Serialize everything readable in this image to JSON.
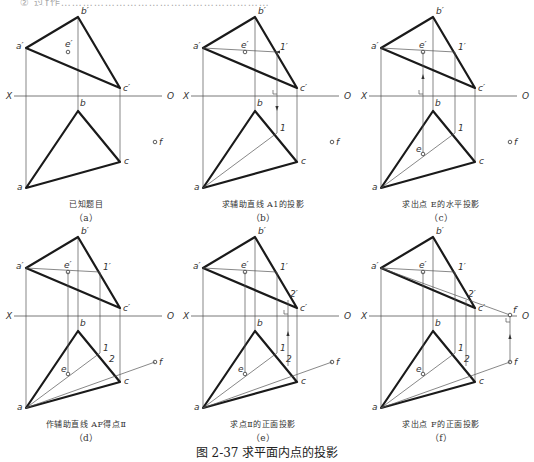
{
  "figure": {
    "title": "图 2-37   求平面内点的投影",
    "top_cut_text": "② 过f作…………………………………………………"
  },
  "labels": {
    "a_prime": "a′",
    "b_prime": "b′",
    "c_prime": "c′",
    "e_prime": "e′",
    "one_prime": "1′",
    "two_prime": "2′",
    "f_prime": "f′",
    "a": "a",
    "b": "b",
    "c": "c",
    "e": "e",
    "one": "1",
    "two": "2",
    "f": "f",
    "X": "X",
    "O": "O"
  },
  "panels": [
    {
      "id": "a",
      "caption": "已知题目",
      "sub": "（a）",
      "steps": [
        "base"
      ]
    },
    {
      "id": "b",
      "caption": "求辅助直线 A1的投影",
      "sub": "（b）",
      "steps": [
        "base",
        "a1"
      ]
    },
    {
      "id": "c",
      "caption": "求出点 E的水平投影",
      "sub": "（c）",
      "steps": [
        "base",
        "a1",
        "e"
      ]
    },
    {
      "id": "d",
      "caption": "作辅助直线 AF得点Ⅱ",
      "sub": "（d）",
      "steps": [
        "base",
        "a1",
        "e",
        "af"
      ]
    },
    {
      "id": "e",
      "caption": "求点Ⅱ的正面投影",
      "sub": "（e）",
      "steps": [
        "base",
        "a1",
        "e",
        "af",
        "two"
      ]
    },
    {
      "id": "f",
      "caption": "求出点 F的正面投影",
      "sub": "（f）",
      "steps": [
        "base",
        "a1",
        "e",
        "af",
        "two",
        "fp"
      ]
    }
  ]
}
